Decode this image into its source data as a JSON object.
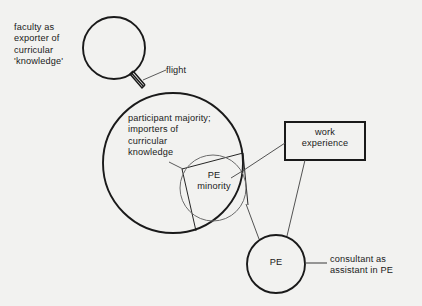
{
  "diagram": {
    "background_color": "#f2f2f0",
    "stroke_color": "#1a1a1a"
  },
  "labels": {
    "faculty": "faculty as\nexporter of\ncurricular\n'knowledge'",
    "flight": "flight",
    "participant_majority": "participant majority;\nimporters of\ncurricular\nknowledge",
    "pe_minority": "PE\nminority",
    "work_experience": "work\nexperience",
    "pe": "PE",
    "consultant": "consultant as\nassistant in PE"
  },
  "shapes": {
    "faculty_circle": {
      "name": "faculty-circle",
      "cx": 114,
      "cy": 48,
      "r": 31
    },
    "participant_circle": {
      "name": "participant-circle",
      "cx": 173,
      "cy": 163,
      "r": 70
    },
    "pe_minority_circle": {
      "name": "pe-minority-circle",
      "cx": 213,
      "cy": 188,
      "r": 33
    },
    "pe_circle": {
      "name": "pe-circle",
      "cx": 276,
      "cy": 264,
      "r": 29
    },
    "work_experience_box": {
      "name": "work-experience-box",
      "x": 285,
      "y": 122,
      "w": 80,
      "h": 38
    }
  },
  "connectors": [
    {
      "name": "flight-connector",
      "from": "faculty-circle",
      "to": "participant-circle"
    },
    {
      "name": "flight-leader-line",
      "from": "flight-connector",
      "to": "flight-label"
    },
    {
      "name": "pe-minority-wedge",
      "from": "participant-circle",
      "to": "pe-minority-circle"
    },
    {
      "name": "work-experience-to-wedge",
      "from": "work-experience-box",
      "to": "pe-minority-wedge"
    },
    {
      "name": "work-experience-to-pe",
      "from": "work-experience-box",
      "to": "pe-circle"
    },
    {
      "name": "participant-to-pe",
      "from": "participant-circle",
      "to": "pe-circle"
    },
    {
      "name": "pe-to-consultant",
      "from": "pe-circle",
      "to": "consultant-label"
    },
    {
      "name": "majority-leader-line",
      "from": "participant-majority-label",
      "to": "pe-minority-wedge"
    }
  ]
}
